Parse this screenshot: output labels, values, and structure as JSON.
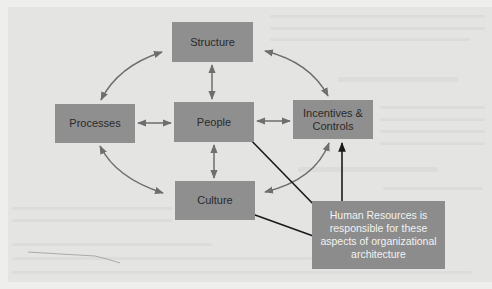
{
  "diagram": {
    "nodes": {
      "structure": {
        "label": "Structure"
      },
      "processes": {
        "label": "Processes"
      },
      "people": {
        "label": "People"
      },
      "incentives": {
        "label": "Incentives & Controls"
      },
      "culture": {
        "label": "Culture"
      }
    },
    "callout": {
      "label": "Human Resources is responsible for these aspects of organizational architecture",
      "points_to": [
        "People",
        "Incentives & Controls",
        "Culture"
      ]
    },
    "edges": [
      {
        "from": "Structure",
        "to": "People",
        "type": "bidirectional"
      },
      {
        "from": "Processes",
        "to": "People",
        "type": "bidirectional"
      },
      {
        "from": "People",
        "to": "Incentives & Controls",
        "type": "bidirectional"
      },
      {
        "from": "People",
        "to": "Culture",
        "type": "bidirectional"
      },
      {
        "from": "Processes",
        "to": "Structure",
        "type": "bidirectional-curved"
      },
      {
        "from": "Structure",
        "to": "Incentives & Controls",
        "type": "bidirectional-curved"
      },
      {
        "from": "Processes",
        "to": "Culture",
        "type": "bidirectional-curved"
      },
      {
        "from": "Culture",
        "to": "Incentives & Controls",
        "type": "bidirectional-curved"
      }
    ],
    "colors": {
      "box_fill": "#8f8f8f",
      "box_text": "#2a2a2a",
      "callout_text": "#f2f2f2",
      "relation_arrow": "#6e6e6e",
      "callout_arrow": "#1a1a1a",
      "background": "#e4e4e2"
    }
  }
}
